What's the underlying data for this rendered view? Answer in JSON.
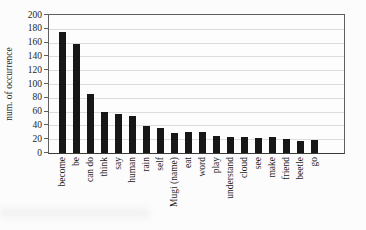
{
  "figure": {
    "background": "#fcfcfc"
  },
  "chart_data": {
    "type": "bar",
    "title": "",
    "xlabel": "",
    "ylabel": "num. of occurrence",
    "categories": [
      "become",
      "be",
      "can do",
      "think",
      "say",
      "human",
      "rain",
      "self",
      "Mugi (name)",
      "eat",
      "word",
      "play",
      "understand",
      "cloud",
      "see",
      "make",
      "friend",
      "beetle",
      "go"
    ],
    "values": [
      175,
      158,
      85,
      60,
      56,
      54,
      39,
      36,
      29,
      31,
      30,
      24,
      23,
      23,
      22,
      23,
      20,
      18,
      19
    ],
    "ylim": [
      0,
      200
    ],
    "ytick_step": 20,
    "ytick_labels": [
      "0",
      "20",
      "40",
      "60",
      "80",
      "100",
      "120",
      "140",
      "160",
      "180",
      "200"
    ],
    "grid": "horizontal",
    "legend": "none",
    "bar_color": "#171717",
    "grid_color": "#dcdcdc",
    "axis_color": "#5f5f5f",
    "text_color": "#1c1c1c"
  }
}
